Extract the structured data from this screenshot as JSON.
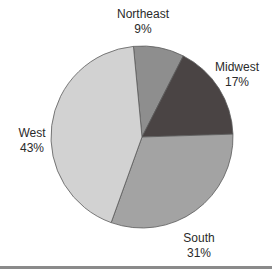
{
  "chart_data": {
    "type": "pie",
    "title": "",
    "categories": [
      "Northeast",
      "Midwest",
      "South",
      "West"
    ],
    "values": [
      9,
      17,
      31,
      43
    ],
    "unit": "%",
    "labels": [
      "9%",
      "17%",
      "31%",
      "43%"
    ],
    "colors": [
      "#8e8e8e",
      "#4a4444",
      "#a3a3a3",
      "#d2d2d2"
    ],
    "start_angle_deg": -5.4,
    "direction": "clockwise",
    "legend": "none (direct labels)"
  },
  "labels": {
    "northeast": {
      "name": "Northeast",
      "pct": "9%"
    },
    "midwest": {
      "name": "Midwest",
      "pct": "17%"
    },
    "south": {
      "name": "South",
      "pct": "31%"
    },
    "west": {
      "name": "West",
      "pct": "43%"
    }
  }
}
